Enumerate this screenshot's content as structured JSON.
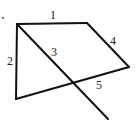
{
  "diagram": {
    "type": "geometry-figure",
    "stroke_color": "#111111",
    "points": {
      "A": [
        17,
        24
      ],
      "B": [
        87,
        23
      ],
      "C": [
        129,
        67
      ],
      "D": [
        16,
        99
      ],
      "E": [
        108,
        119
      ]
    },
    "segments": [
      {
        "id": "1",
        "from": "A",
        "to": "B",
        "label": "1",
        "label_pos": [
          50,
          19
        ]
      },
      {
        "id": "2",
        "from": "A",
        "to": "D",
        "label": "2",
        "label_pos": [
          7,
          65
        ]
      },
      {
        "id": "3",
        "from": "A",
        "to": "E",
        "label": "3",
        "label_pos": [
          51,
          56
        ]
      },
      {
        "id": "4",
        "from": "B",
        "to": "C",
        "label": "4",
        "label_pos": [
          110,
          45
        ]
      },
      {
        "id": "5",
        "from": "D",
        "to": "C",
        "label": "5",
        "label_pos": [
          96,
          89
        ]
      }
    ],
    "labels": {
      "l1": "1",
      "l2": "2",
      "l3": "3",
      "l4": "4",
      "l5": "5"
    },
    "marker_dot": [
      3,
      18
    ]
  }
}
